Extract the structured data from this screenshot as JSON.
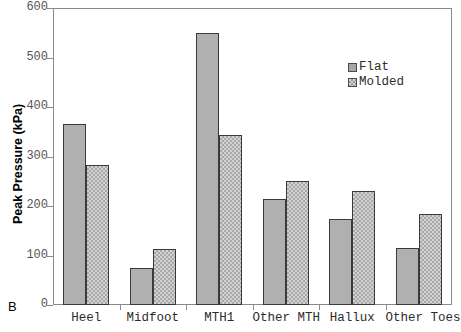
{
  "panel": {
    "letter": "B"
  },
  "chart_data": {
    "type": "bar",
    "title": "",
    "xlabel": "",
    "ylabel": "Peak Pressure (kPa)",
    "ylim": [
      0,
      600
    ],
    "yticks": [
      0,
      100,
      200,
      300,
      400,
      500,
      600
    ],
    "ytick_labels": [
      "0",
      "100",
      "200",
      "300",
      "400",
      "500",
      "600"
    ],
    "grid": false,
    "legend_position": "upper-right-inside",
    "categories": [
      "Heel",
      "Midfoot",
      "MTH1",
      "Other MTH",
      "Hallux",
      "Other Toes"
    ],
    "series": [
      {
        "name": "Flat",
        "color": "#b0b0b0",
        "pattern": "solid",
        "values": [
          365,
          75,
          550,
          214,
          174,
          116
        ]
      },
      {
        "name": "Molded",
        "color": "#d2d2d2",
        "pattern": "checker",
        "values": [
          283,
          114,
          343,
          250,
          230,
          184
        ]
      }
    ]
  },
  "legend": {
    "items": [
      {
        "label": "Flat"
      },
      {
        "label": "Molded"
      }
    ]
  }
}
